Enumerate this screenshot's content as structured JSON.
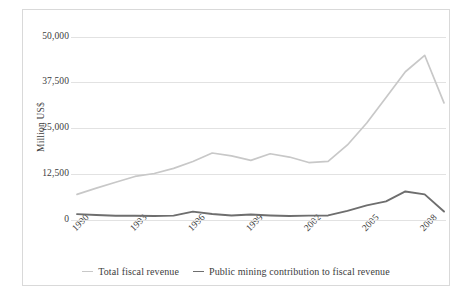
{
  "chart_data": {
    "type": "line",
    "title": "",
    "xlabel": "",
    "ylabel": "Million US$",
    "ylim": [
      0,
      50000
    ],
    "xlim": [
      1990,
      2009
    ],
    "grid": true,
    "legend_position": "bottom",
    "ytick_labels": [
      "50,000",
      "37,500",
      "25,000",
      "12,500",
      "0"
    ],
    "ytick_values": [
      50000,
      37500,
      25000,
      12500,
      0
    ],
    "xtick_labels": [
      "1990",
      "1993",
      "1996",
      "1999",
      "2002",
      "2005",
      "2008"
    ],
    "xtick_values": [
      1990,
      1993,
      1996,
      1999,
      2002,
      2005,
      2008
    ],
    "x": [
      1990,
      1991,
      1992,
      1993,
      1994,
      1995,
      1996,
      1997,
      1998,
      1999,
      2000,
      2001,
      2002,
      2003,
      2004,
      2005,
      2006,
      2007,
      2008,
      2009
    ],
    "series": [
      {
        "name": "Total fiscal revenue",
        "color": "#c8c8c8",
        "values": [
          7000,
          8700,
          10300,
          11900,
          12700,
          14100,
          16000,
          18300,
          17500,
          16300,
          18100,
          17200,
          15700,
          16000,
          20500,
          26500,
          33500,
          40500,
          45000,
          32000
        ]
      },
      {
        "name": "Public mining contribution to fiscal revenue",
        "color": "#6e6e6e",
        "values": [
          1600,
          1350,
          1150,
          1150,
          1100,
          1200,
          2300,
          1650,
          1250,
          1500,
          1250,
          1100,
          1200,
          1250,
          2500,
          4000,
          5100,
          7800,
          7000,
          2300
        ]
      }
    ]
  },
  "legend": {
    "entries": [
      {
        "label": "Total fiscal revenue",
        "color": "#c8c8c8"
      },
      {
        "label": "Public mining contribution to fiscal revenue",
        "color": "#6e6e6e"
      }
    ]
  },
  "axes": {
    "y_title": "Million US$"
  },
  "style": {
    "grid_color": "#e2e2e2",
    "frame_color": "#d9d9d9",
    "text_color": "#3d3d3d",
    "background": "#ffffff"
  }
}
